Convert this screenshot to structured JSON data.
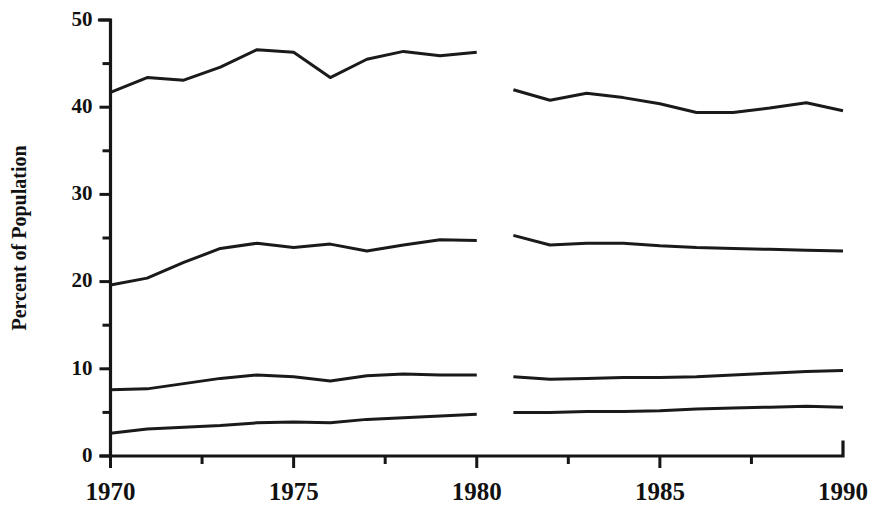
{
  "chart_data": {
    "type": "line",
    "title": "",
    "subtitle": "",
    "xlabel": "",
    "ylabel": "Percent of Population",
    "xlim": [
      1970,
      1990
    ],
    "ylim": [
      0,
      50
    ],
    "grid": false,
    "legend": "none",
    "x_major_ticks": [
      1970,
      1975,
      1980,
      1985,
      1990
    ],
    "x_major_tick_labels": [
      "1970",
      "1975",
      "1980",
      "1985",
      "1990"
    ],
    "x_minor_ticks": [
      1972.5,
      1977.5,
      1982.5,
      1987.5
    ],
    "y_major_ticks": [
      0,
      10,
      20,
      30,
      40,
      50
    ],
    "y_major_tick_labels": [
      "0",
      "10",
      "20",
      "30",
      "40",
      "50"
    ],
    "y_minor_ticks": [
      5,
      15,
      25,
      35,
      45
    ],
    "series_break": {
      "present": true,
      "gap_between_years": [
        1980,
        1981
      ],
      "note": "All four series are drawn as two separate segments with a break between 1980 and 1981."
    },
    "series": [
      {
        "name": "series-1",
        "segments": [
          {
            "x": [
              1970,
              1971,
              1972,
              1973,
              1974,
              1975,
              1976,
              1977,
              1978,
              1979,
              1980
            ],
            "values": [
              41.7,
              43.4,
              43.1,
              44.6,
              46.6,
              46.3,
              43.4,
              45.5,
              46.4,
              45.9,
              46.3
            ]
          },
          {
            "x": [
              1981,
              1982,
              1983,
              1984,
              1985,
              1986,
              1987,
              1988,
              1989,
              1990
            ],
            "values": [
              42.0,
              40.8,
              41.6,
              41.1,
              40.4,
              39.4,
              39.4,
              39.9,
              40.5,
              39.6
            ]
          }
        ]
      },
      {
        "name": "series-2",
        "segments": [
          {
            "x": [
              1970,
              1971,
              1972,
              1973,
              1974,
              1975,
              1976,
              1977,
              1978,
              1979,
              1980
            ],
            "values": [
              19.6,
              20.4,
              22.2,
              23.8,
              24.4,
              23.9,
              24.3,
              23.5,
              24.2,
              24.8,
              24.7
            ]
          },
          {
            "x": [
              1981,
              1982,
              1983,
              1984,
              1985,
              1986,
              1987,
              1988,
              1989,
              1990
            ],
            "values": [
              25.3,
              24.2,
              24.4,
              24.4,
              24.1,
              23.9,
              23.8,
              23.7,
              23.6,
              23.5
            ]
          }
        ]
      },
      {
        "name": "series-3",
        "segments": [
          {
            "x": [
              1970,
              1971,
              1972,
              1973,
              1974,
              1975,
              1976,
              1977,
              1978,
              1979,
              1980
            ],
            "values": [
              7.6,
              7.7,
              8.3,
              8.9,
              9.3,
              9.1,
              8.6,
              9.2,
              9.4,
              9.3,
              9.3
            ]
          },
          {
            "x": [
              1981,
              1982,
              1983,
              1984,
              1985,
              1986,
              1987,
              1988,
              1989,
              1990
            ],
            "values": [
              9.1,
              8.8,
              8.9,
              9.0,
              9.0,
              9.1,
              9.3,
              9.5,
              9.7,
              9.8
            ]
          }
        ]
      },
      {
        "name": "series-4",
        "segments": [
          {
            "x": [
              1970,
              1971,
              1972,
              1973,
              1974,
              1975,
              1976,
              1977,
              1978,
              1979,
              1980
            ],
            "values": [
              2.6,
              3.1,
              3.3,
              3.5,
              3.8,
              3.9,
              3.8,
              4.2,
              4.4,
              4.6,
              4.8
            ]
          },
          {
            "x": [
              1981,
              1982,
              1983,
              1984,
              1985,
              1986,
              1987,
              1988,
              1989,
              1990
            ],
            "values": [
              5.0,
              5.0,
              5.1,
              5.1,
              5.2,
              5.4,
              5.5,
              5.6,
              5.7,
              5.6
            ]
          }
        ]
      }
    ],
    "colors": {
      "line": "#1a1a1a",
      "axis": "#161616",
      "background": "#ffffff",
      "text": "#111111"
    }
  }
}
